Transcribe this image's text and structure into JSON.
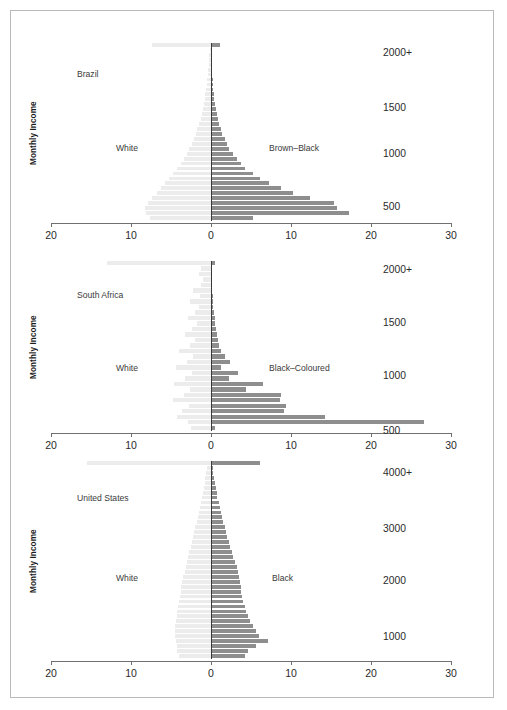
{
  "figure": {
    "y_axis_title": "Monthly Income",
    "x_ticks": [
      "20",
      "10",
      "0",
      "10",
      "20",
      "30"
    ],
    "x_tick_values": [
      -20,
      -10,
      0,
      10,
      20,
      30
    ]
  },
  "chart_data": {
    "type": "bar",
    "title": "",
    "xlabel": "",
    "ylabel": "Monthly Income",
    "orientation": "horizontal-back-to-back population pyramid",
    "xlim": [
      -20,
      30
    ],
    "grid": false,
    "legend_position": "inline annotations",
    "colors": {
      "left_series": "#ececec",
      "right_series": "#8e8e8e",
      "zero_line": "#3a3a3a",
      "axis": "#707070",
      "frame": "#b9b9b9"
    },
    "panels": [
      {
        "panel_name": "brazil",
        "country_label": "Brazil",
        "left_series_label": "White",
        "right_series_label": "Brown–Black",
        "y_tick_labels": [
          "2000+",
          "1500",
          "1000",
          "500"
        ],
        "y_tick_values": [
          2000,
          1500,
          1000,
          500
        ],
        "n_bins": 36,
        "left_values": [
          7.4,
          0.15,
          0.2,
          0.25,
          0.3,
          0.35,
          0.4,
          0.45,
          0.5,
          0.6,
          0.7,
          0.8,
          0.9,
          1.0,
          1.15,
          1.3,
          1.5,
          1.7,
          1.9,
          2.1,
          2.4,
          2.7,
          3.0,
          3.4,
          3.8,
          4.2,
          4.7,
          5.2,
          5.7,
          6.2,
          6.8,
          7.4,
          7.9,
          8.3,
          8.1,
          7.6
        ],
        "right_values": [
          1.1,
          0.05,
          0.07,
          0.1,
          0.12,
          0.15,
          0.18,
          0.22,
          0.26,
          0.3,
          0.36,
          0.42,
          0.5,
          0.6,
          0.7,
          0.85,
          1.0,
          1.2,
          1.4,
          1.7,
          2.0,
          2.3,
          2.7,
          3.2,
          3.7,
          4.3,
          5.2,
          6.1,
          7.3,
          8.8,
          10.2,
          12.4,
          15.4,
          15.8,
          17.3,
          5.3
        ]
      },
      {
        "panel_name": "south_africa",
        "country_label": "South Africa",
        "left_series_label": "White",
        "right_series_label": "Black–Coloured",
        "y_tick_labels": [
          "2000+",
          "1500",
          "1000",
          "500"
        ],
        "y_tick_values": [
          2000,
          1500,
          1000,
          500
        ],
        "n_bins": 31,
        "left_values": [
          13.0,
          1.3,
          1.5,
          1.0,
          1.2,
          2.2,
          1.4,
          2.6,
          1.5,
          2.0,
          2.9,
          1.8,
          2.4,
          3.2,
          2.0,
          2.6,
          4.0,
          2.2,
          3.0,
          4.4,
          2.4,
          3.2,
          4.6,
          2.6,
          3.4,
          4.7,
          2.8,
          3.6,
          4.2,
          2.9,
          2.5
        ],
        "right_values": [
          0.5,
          0.1,
          0.1,
          0.12,
          0.15,
          0.18,
          0.2,
          0.25,
          0.3,
          0.35,
          0.45,
          0.5,
          0.6,
          0.75,
          0.9,
          1.0,
          1.3,
          1.7,
          2.4,
          1.3,
          3.4,
          2.3,
          6.5,
          4.4,
          8.7,
          8.6,
          9.4,
          9.1,
          14.2,
          26.6,
          0.5
        ]
      },
      {
        "panel_name": "united_states",
        "country_label": "United States",
        "left_series_label": "White",
        "right_series_label": "Black",
        "y_tick_labels": [
          "4000+",
          "3000",
          "2000",
          "1000"
        ],
        "y_tick_values": [
          4000,
          3000,
          2000,
          1000
        ],
        "n_bins": 40,
        "left_values": [
          15.5,
          0.5,
          0.6,
          0.7,
          0.8,
          0.9,
          1.0,
          1.1,
          1.2,
          1.35,
          1.5,
          1.65,
          1.8,
          1.95,
          2.1,
          2.25,
          2.4,
          2.55,
          2.7,
          2.85,
          3.0,
          3.15,
          3.3,
          3.45,
          3.6,
          3.7,
          3.8,
          3.9,
          4.0,
          4.1,
          4.2,
          4.3,
          4.4,
          4.45,
          4.5,
          4.5,
          4.4,
          4.3,
          4.2,
          4.0
        ],
        "right_values": [
          6.1,
          0.2,
          0.3,
          0.4,
          0.5,
          0.6,
          0.7,
          0.8,
          0.95,
          1.1,
          1.25,
          1.4,
          1.55,
          1.7,
          1.85,
          2.0,
          2.2,
          2.4,
          2.6,
          2.8,
          3.0,
          3.2,
          3.4,
          3.5,
          3.6,
          3.7,
          3.8,
          3.9,
          4.0,
          4.2,
          4.4,
          4.6,
          4.9,
          5.2,
          5.6,
          6.0,
          7.1,
          5.6,
          4.6,
          4.3
        ]
      }
    ]
  }
}
